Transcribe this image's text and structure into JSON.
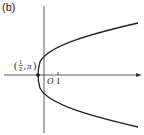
{
  "panel_label": "(b)",
  "diagram": {
    "type": "polar-graph-parabola",
    "vertex_label": "(1/2, π)",
    "vertex_frac_num": "1",
    "vertex_frac_den": "2",
    "vertex_angle": "π",
    "origin_label": "O",
    "tick_label": "1",
    "axis_color": "#333333",
    "curve_color": "#222222"
  }
}
